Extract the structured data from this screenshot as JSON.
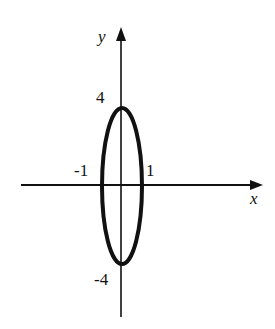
{
  "figure": {
    "axes": {
      "x_label": "x",
      "y_label": "y",
      "x_ticks": [
        "-1",
        "1"
      ],
      "y_ticks": [
        "4",
        "-4"
      ]
    },
    "curve": {
      "type": "ellipse",
      "center": [
        0,
        0
      ],
      "semi_axis_x": 1,
      "semi_axis_y": 4
    },
    "colors": {
      "ink": "#111111",
      "background": "#ffffff"
    }
  }
}
